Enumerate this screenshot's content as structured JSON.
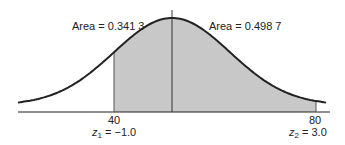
{
  "chart_data": {
    "type": "area",
    "title": "",
    "annotations": [
      {
        "label": "Area = 0.341 3",
        "region": "from 40 to mean"
      },
      {
        "label": "Area = 0.498 7",
        "region": "from mean to 80"
      }
    ],
    "ticks": [
      {
        "value": "40",
        "z_label": "z",
        "z_sub": "1",
        "z_value": " = −1.0"
      },
      {
        "value": "80",
        "z_label": "z",
        "z_sub": "2",
        "z_value": " = 3.0"
      }
    ],
    "shade_color": "#c8c8c8",
    "curve_color": "#222222"
  }
}
